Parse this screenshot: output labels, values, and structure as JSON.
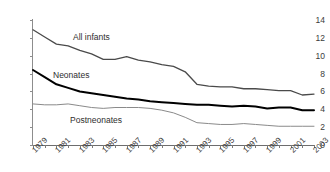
{
  "top_caption": "",
  "chart_data": {
    "type": "line",
    "title": "",
    "subtitle": "",
    "xlabel": "",
    "ylabel": "",
    "xlim": [
      1979,
      2003
    ],
    "ylim": [
      0,
      14
    ],
    "grid": false,
    "legend_position": "inline-annotations",
    "x": [
      1979,
      1980,
      1981,
      1982,
      1983,
      1984,
      1985,
      1986,
      1987,
      1988,
      1989,
      1990,
      1991,
      1992,
      1993,
      1994,
      1995,
      1996,
      1997,
      1998,
      1999,
      2000,
      2001,
      2002,
      2003
    ],
    "xtick_labels": [
      "1979",
      "1981",
      "1983",
      "1985",
      "1987",
      "1989",
      "1991",
      "1993",
      "1995",
      "1997",
      "1999",
      "2001",
      "2003"
    ],
    "ytick_labels": [
      "0",
      "2",
      "4",
      "6",
      "8",
      "10",
      "12",
      "14"
    ],
    "ytick_values": [
      0,
      2,
      4,
      6,
      8,
      10,
      12,
      14
    ],
    "series": [
      {
        "name": "All infants",
        "color": "#4a4a4a",
        "width": 1.3,
        "values": [
          12.9,
          12.1,
          11.3,
          11.1,
          10.6,
          10.2,
          9.6,
          9.6,
          9.9,
          9.5,
          9.3,
          9.0,
          8.8,
          8.2,
          6.8,
          6.6,
          6.5,
          6.5,
          6.3,
          6.3,
          6.2,
          6.1,
          6.1,
          5.6,
          5.7
        ]
      },
      {
        "name": "Neonates",
        "color": "#000000",
        "width": 2.0,
        "values": [
          8.4,
          7.6,
          6.8,
          6.4,
          6.0,
          5.8,
          5.6,
          5.4,
          5.2,
          5.1,
          4.9,
          4.8,
          4.7,
          4.6,
          4.5,
          4.5,
          4.4,
          4.3,
          4.4,
          4.3,
          4.1,
          4.2,
          4.2,
          3.9,
          3.9
        ]
      },
      {
        "name": "Postneonates",
        "color": "#8a8a8a",
        "width": 1.0,
        "values": [
          4.6,
          4.5,
          4.5,
          4.6,
          4.4,
          4.2,
          4.1,
          4.2,
          4.2,
          4.2,
          4.1,
          3.9,
          3.6,
          3.1,
          2.5,
          2.4,
          2.3,
          2.3,
          2.4,
          2.3,
          2.2,
          2.1,
          2.1,
          2.1,
          2.1
        ]
      }
    ]
  }
}
